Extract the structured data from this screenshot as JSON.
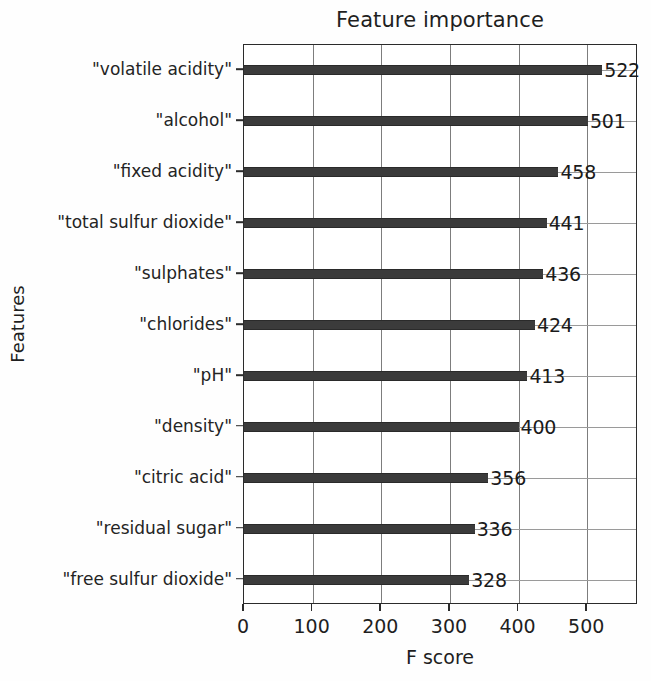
{
  "chart_data": {
    "type": "bar",
    "orientation": "horizontal",
    "title": "Feature importance",
    "xlabel": "F score",
    "ylabel": "Features",
    "xlim": [
      0,
      574
    ],
    "grid": true,
    "legend": null,
    "categories": [
      "\"volatile acidity\"",
      "\"alcohol\"",
      "\"fixed acidity\"",
      "\"total sulfur dioxide\"",
      "\"sulphates\"",
      "\"chlorides\"",
      "\"pH\"",
      "\"density\"",
      "\"citric acid\"",
      "\"residual sugar\"",
      "\"free sulfur dioxide\""
    ],
    "values": [
      522,
      501,
      458,
      441,
      436,
      424,
      413,
      400,
      356,
      336,
      328
    ],
    "value_labels": [
      "522",
      "501",
      "458",
      "441",
      "436",
      "424",
      "413",
      "400",
      "356",
      "336",
      "328"
    ],
    "xticks": [
      0,
      100,
      200,
      300,
      400,
      500
    ],
    "xtick_labels": [
      "0",
      "100",
      "200",
      "300",
      "400",
      "500"
    ],
    "bar_color": "#3b3b3b",
    "grid_color": "#8a8a8a",
    "axis_color": "#2b2b2b",
    "text_color": "#1f1f1f",
    "background": "#ffffff"
  }
}
